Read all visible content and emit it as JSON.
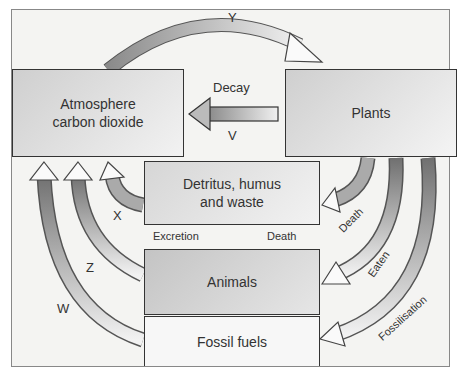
{
  "diagram": {
    "nodes": {
      "atmosphere": "Atmosphere\ncarbon dioxide",
      "atmosphere_line1": "Atmosphere",
      "atmosphere_line2": "carbon dioxide",
      "plants": "Plants",
      "detritus_line1": "Detritus, humus",
      "detritus_line2": "and waste",
      "animals": "Animals",
      "fossil_fuels": "Fossil fuels"
    },
    "labels": {
      "y": "Y",
      "decay": "Decay",
      "v": "V",
      "x": "X",
      "z": "Z",
      "w": "W",
      "excretion": "Excretion",
      "death_center": "Death",
      "death_right": "Death",
      "eaten": "Eaten",
      "fossilisation": "Fossilisation"
    },
    "edges": [
      {
        "from": "Atmosphere carbon dioxide",
        "to": "Plants",
        "label": "Y"
      },
      {
        "from": "Plants",
        "to": "Atmosphere carbon dioxide",
        "label": "V (Decay)"
      },
      {
        "from": "Detritus, humus and waste",
        "to": "Atmosphere carbon dioxide",
        "label": "X"
      },
      {
        "from": "Animals",
        "to": "Atmosphere carbon dioxide",
        "label": "Z"
      },
      {
        "from": "Fossil fuels",
        "to": "Atmosphere carbon dioxide",
        "label": "W"
      },
      {
        "from": "Animals",
        "to": "Detritus, humus and waste",
        "label": "Excretion / Death"
      },
      {
        "from": "Plants",
        "to": "Detritus, humus and waste",
        "label": "Death"
      },
      {
        "from": "Plants",
        "to": "Animals",
        "label": "Eaten"
      },
      {
        "from": "Plants",
        "to": "Fossil fuels",
        "label": "Fossilisation"
      }
    ]
  }
}
